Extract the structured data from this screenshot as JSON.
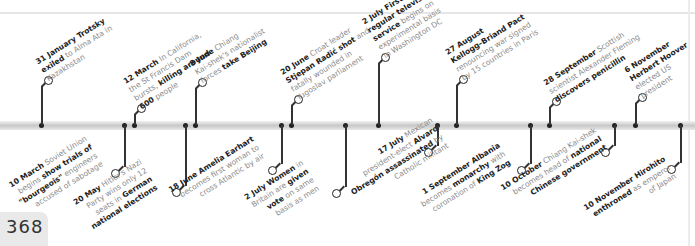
{
  "page": {
    "number": "368"
  },
  "timeline": {
    "bar_color": "#c8c8c8",
    "upper": [
      {
        "date": "31 January",
        "lead": "Trotsky",
        "lines": [
          "<b>31 January Trotsky</b>",
          "<b>exiled</b> to Alma Ata in",
          "Kazakhstan"
        ]
      },
      {
        "date": "12 March",
        "lines": [
          "<b>12 March</b> In California,",
          "the St Francis Dam",
          "bursts, <b>killing around</b>",
          "<b>600</b> people"
        ]
      },
      {
        "date": "8 June",
        "lines": [
          "<b>8 June</b> Chiang",
          "Kai-shek's nationalist",
          "forces <b>take Beijing</b>"
        ]
      },
      {
        "date": "20 June",
        "lines": [
          "<b>20 June</b> Croat leader",
          "<b>Stjepan Radić shot</b> and",
          "fatally wounded in",
          "Yugoslav parliament"
        ]
      },
      {
        "date": "2 July",
        "lines": [
          "<b>2 July First</b>",
          "<b>regular television</b>",
          "<b>service</b> begins on",
          "experimental basis",
          "in Washington DC"
        ]
      },
      {
        "date": "27 August",
        "lines": [
          "<b>27 August</b>",
          "<b>Kellogg–Briand Pact</b>",
          "renouncing war signed",
          "by 15 countries in Paris"
        ]
      },
      {
        "date": "28 September",
        "lines": [
          "<b>28 September</b> Scottish",
          "scientist Alexander Fleming",
          "<b>discovers penicillin</b>"
        ]
      },
      {
        "date": "6 November",
        "lines": [
          "<b>6 November</b>",
          "<b>Herbert Hoover</b>",
          "elected US",
          "president"
        ]
      }
    ],
    "lower": [
      {
        "date": "10 March",
        "lines": [
          "<b>10 March</b> Soviet Union",
          "begins <b>show trials of</b>",
          "<b>\"bourgeois\"</b> engineers",
          "accused of sabotage"
        ]
      },
      {
        "date": "20 May",
        "lines": [
          "<b>20 May</b> Hitler's Nazi",
          "Party wins only 12",
          "seats in <b>German</b>",
          "<b>national elections</b>"
        ]
      },
      {
        "date": "18 June",
        "lines": [
          "<b>18 June Amelia Earhart</b>",
          "becomes first woman to",
          "cross Atlantic by air"
        ]
      },
      {
        "date": "2 July",
        "lines": [
          "<b>2 July Women</b> in",
          "Britain are <b>given</b>",
          "<b>vote</b> on same",
          "basis as men"
        ]
      },
      {
        "date": "17 July",
        "lines": [
          "<b>17 July</b> Mexican",
          "president-elect <b>Alvaro</b>",
          "<b>Obregón assassinated</b> by",
          "Catholic militant"
        ]
      },
      {
        "date": "1 September",
        "lines": [
          "<b>1 September Albania</b>",
          "becomes <b>monarchy</b> with",
          "coronation of <b>King Zog</b>"
        ]
      },
      {
        "date": "10 October",
        "lines": [
          "<b>10 October</b> Chiang Kai-shek",
          "becomes head of <b>national</b>",
          "<b>Chinese government</b>"
        ]
      },
      {
        "date": "10 November",
        "lines": [
          "<b>10 November Hirohito</b>",
          "<b>enthroned</b> as emperor",
          "of Japan"
        ]
      }
    ]
  }
}
